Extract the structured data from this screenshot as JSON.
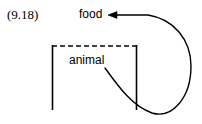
{
  "figure": {
    "equation_number": "(9.18)",
    "background_color": "#ffffff",
    "stroke_color": "#000000",
    "width": 202,
    "height": 124
  },
  "nodes": {
    "food": {
      "label": "food",
      "x": 79,
      "y": 8
    },
    "animal": {
      "label": "animal",
      "x": 69,
      "y": 54
    }
  },
  "bracket": {
    "name": "animal-bracket",
    "left_x": 52,
    "right_x": 137,
    "top_y": 46,
    "bottom_y": 110,
    "top_style": "dashed",
    "side_style": "solid",
    "dash_pattern": "5,3"
  },
  "arrow": {
    "name": "feedback-loop-arrow",
    "from": "animal",
    "to": "food",
    "direction": "left",
    "head_x": 110,
    "head_y": 15,
    "start_x": 105,
    "start_y": 68,
    "rightmost_x": 192,
    "bottom_y": 115,
    "stroke_width": 1.4
  }
}
